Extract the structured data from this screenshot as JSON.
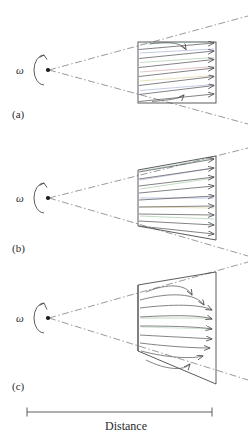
{
  "figure": {
    "title": "",
    "axis_label": "Distance",
    "rotation_symbol": "ω",
    "panels": [
      {
        "id": "a",
        "label": "(a)",
        "shape": "rectangle",
        "description": "uniform-width region with slanted flow lines and rightward arrowheads",
        "apex": {
          "x": 48,
          "y": 70
        },
        "region": {
          "x0": 138,
          "y0": 42,
          "x1": 216,
          "y1": 103
        },
        "region_left_half_height": 30.5,
        "region_right_half_height": 30.5,
        "n_flowlines": 7,
        "flowline_slant": "tilted-up-to-right",
        "arrowheads": "right"
      },
      {
        "id": "b",
        "label": "(b)",
        "shape": "trapezoid-expanding",
        "description": "region widening to the right with flow lines converging toward apex",
        "apex": {
          "x": 48,
          "y": 198
        },
        "region": {
          "x0": 138,
          "y0": 170,
          "x1": 216,
          "y1": 250
        },
        "region_left_half_height": 28,
        "region_right_half_height": 42,
        "n_flowlines": 9,
        "flowline_slant": "radial-fan",
        "arrowheads": "right"
      },
      {
        "id": "c",
        "label": "(c)",
        "shape": "trapezoid-expanding",
        "description": "region widening to the right with curved flow lines bending outward near the edges",
        "apex": {
          "x": 48,
          "y": 318
        },
        "region": {
          "x0": 138,
          "y0": 282,
          "x1": 216,
          "y1": 396
        },
        "region_left_half_height": 33,
        "region_right_half_height": 56,
        "n_flowlines": 9,
        "flowline_slant": "curved-outward",
        "arrowheads": "right-curved"
      }
    ],
    "scale_bar": {
      "label": "Distance",
      "x_start": 27,
      "x_end": 212,
      "y": 412,
      "tick_height": 9
    },
    "colors": {
      "line": "#4a4a4e",
      "flow": "#5a5a5e",
      "cone": "#6e6e72",
      "text": "#2b2b2b",
      "background": "#ffffff",
      "tint_green": "#6fae79",
      "tint_red": "#c07a7a",
      "tint_blue": "#6d7fc0",
      "tint_yellow": "#c9b96a"
    }
  }
}
